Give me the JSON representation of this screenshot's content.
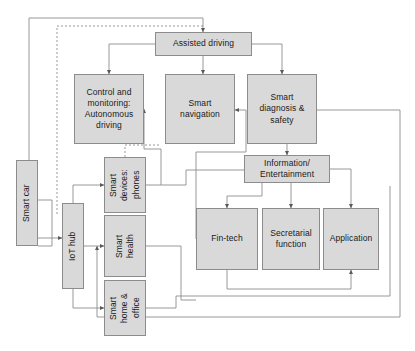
{
  "diagram": {
    "fill_color": "#d9d9d9",
    "border_color": "#8c8c8c",
    "line_color": "#7f7f7f",
    "background": "#ffffff",
    "nodes": [
      {
        "id": "smart-car",
        "label": "Smart car",
        "orientation": "vertical",
        "x": 16,
        "y": 160,
        "w": 22,
        "h": 86
      },
      {
        "id": "assisted-driving",
        "label": "Assisted driving",
        "orientation": "horizontal",
        "x": 155,
        "y": 32,
        "w": 97,
        "h": 24
      },
      {
        "id": "control-monitoring",
        "label": "Control and\nmonitoring:\nAutonomous\ndriving",
        "orientation": "horizontal",
        "x": 74,
        "y": 74,
        "w": 70,
        "h": 70
      },
      {
        "id": "smart-navigation",
        "label": "Smart\nnavigation",
        "orientation": "horizontal",
        "x": 165,
        "y": 74,
        "w": 70,
        "h": 70
      },
      {
        "id": "smart-diagnosis",
        "label": "Smart\ndiagnosis &\nsafety",
        "orientation": "horizontal",
        "x": 247,
        "y": 74,
        "w": 70,
        "h": 70
      },
      {
        "id": "information-enter",
        "label": "Information/\nEntertainment",
        "orientation": "horizontal",
        "x": 244,
        "y": 155,
        "w": 86,
        "h": 28
      },
      {
        "id": "smart-devices",
        "label": "Smart\ndevices:\nphones",
        "orientation": "vertical",
        "x": 104,
        "y": 157,
        "w": 42,
        "h": 56
      },
      {
        "id": "iot-hub",
        "label": "IoT hub",
        "orientation": "vertical",
        "x": 62,
        "y": 203,
        "w": 22,
        "h": 86
      },
      {
        "id": "smart-health",
        "label": "Smart\nhealth",
        "orientation": "vertical",
        "x": 104,
        "y": 215,
        "w": 42,
        "h": 62
      },
      {
        "id": "smart-home-office",
        "label": "Smart\nhome &\noffice",
        "orientation": "vertical",
        "x": 104,
        "y": 280,
        "w": 42,
        "h": 56
      },
      {
        "id": "fin-tech",
        "label": "Fin-tech",
        "orientation": "horizontal",
        "x": 196,
        "y": 208,
        "w": 62,
        "h": 62
      },
      {
        "id": "secretarial",
        "label": "Secretarial\nfunction",
        "orientation": "horizontal",
        "x": 262,
        "y": 208,
        "w": 58,
        "h": 62
      },
      {
        "id": "application",
        "label": "Application",
        "orientation": "horizontal",
        "x": 323,
        "y": 208,
        "w": 56,
        "h": 62
      }
    ]
  }
}
